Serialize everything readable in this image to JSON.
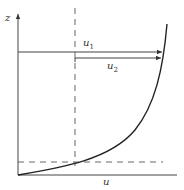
{
  "diagram": {
    "title": "",
    "axes": {
      "vertical_label": "z",
      "horizontal_label": "u"
    },
    "arrows": [
      {
        "label": "u",
        "subscript": "1",
        "from": "axis",
        "to": "curve"
      },
      {
        "label": "u",
        "subscript": "2",
        "from": "dashed-line",
        "to": "curve"
      }
    ],
    "guides": [
      "vertical dashed line",
      "horizontal dashed line near bottom"
    ],
    "colors": {
      "line": "#333333",
      "background": "#ffffff"
    }
  }
}
